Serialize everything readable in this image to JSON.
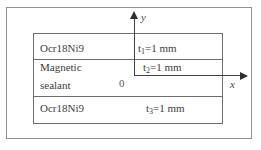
{
  "figure": {
    "layers": [
      {
        "material": "Ocr18Ni9",
        "thickness": {
          "base": "t",
          "sub": "1",
          "rest": "=1 mm"
        }
      },
      {
        "material": "Magnetic sealant",
        "material_lines": [
          "Magnetic",
          "sealant"
        ],
        "thickness": {
          "base": "t",
          "sub": "2",
          "rest": "=1 mm"
        }
      },
      {
        "material": "Ocr18Ni9",
        "thickness": {
          "base": "t",
          "sub": "3",
          "rest": "=1 mm"
        }
      }
    ],
    "axes": {
      "x_label": "x",
      "y_label": "y",
      "origin_label": "0"
    },
    "colors": {
      "background": "#ffffff",
      "frame_line": "#909090",
      "box_line": "#6f6f6f",
      "axis_line": "#3f3f3f",
      "text": "#3d3d3d"
    }
  }
}
